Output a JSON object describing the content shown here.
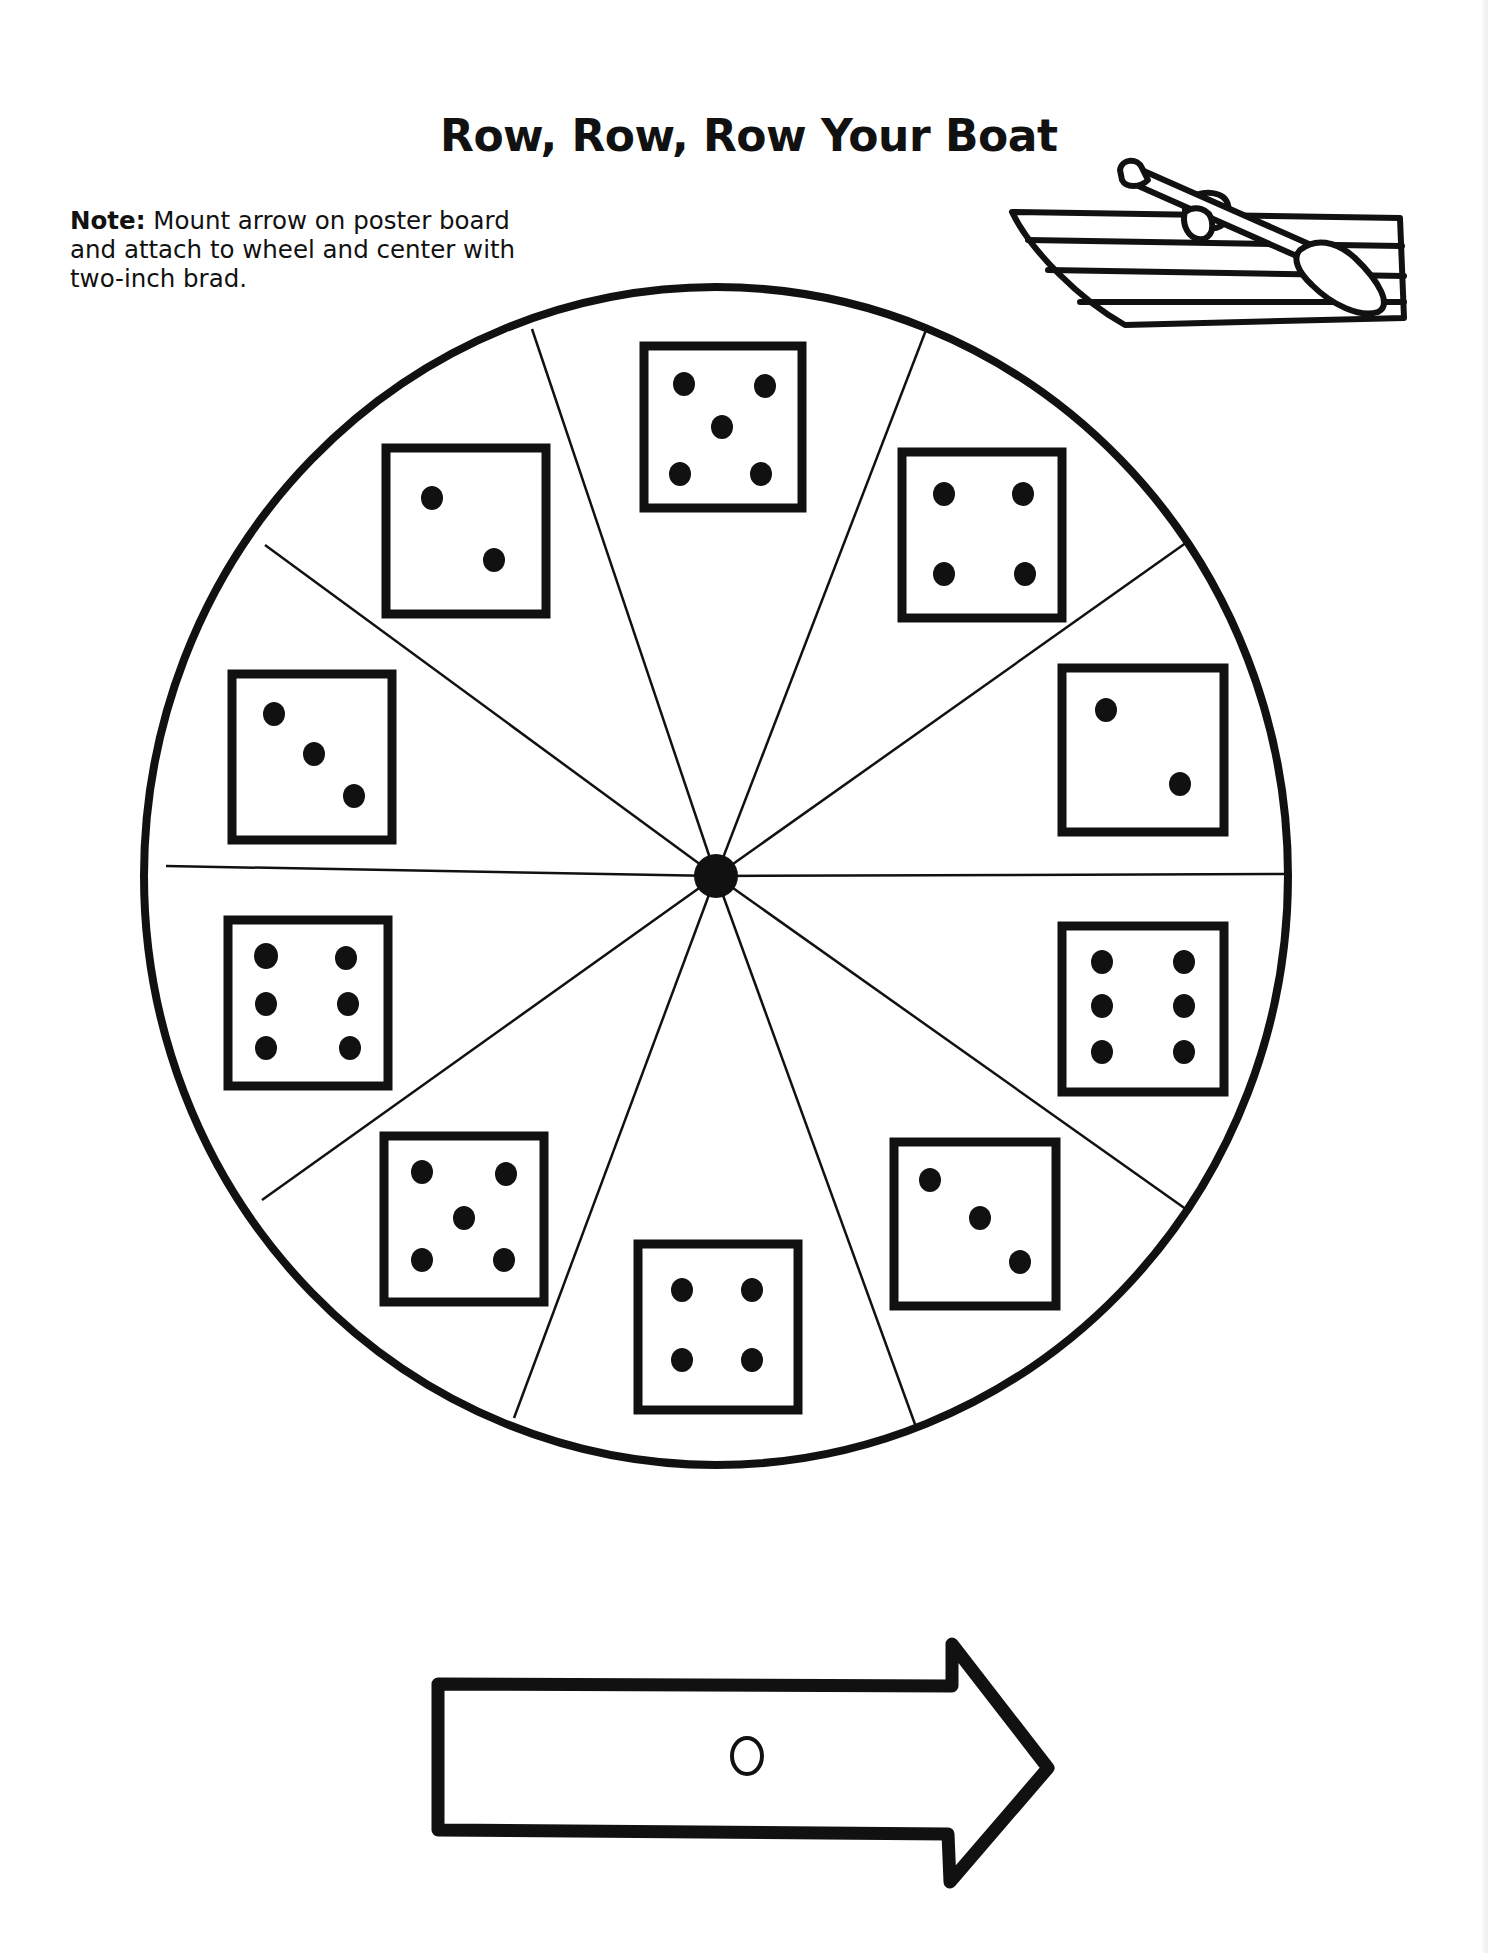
{
  "page": {
    "title": "Row, Row, Row Your Boat",
    "note": {
      "label": "Note:",
      "text": "Mount arrow on poster board and attach to wheel and center with two-inch brad."
    }
  },
  "illustrations": {
    "boat": "rowboat-with-oar-icon",
    "arrow": "spinner-arrow-cutout"
  },
  "spinner_wheel": {
    "segments": 10,
    "dice_faces_clockwise_from_top": [
      5,
      4,
      2,
      6,
      3,
      4,
      5,
      6,
      3,
      2
    ],
    "center": "brad-hub"
  },
  "arrow": {
    "direction": "right",
    "hole": "brad-hole"
  },
  "colors": {
    "ink": "#111111",
    "paper": "#ffffff"
  }
}
